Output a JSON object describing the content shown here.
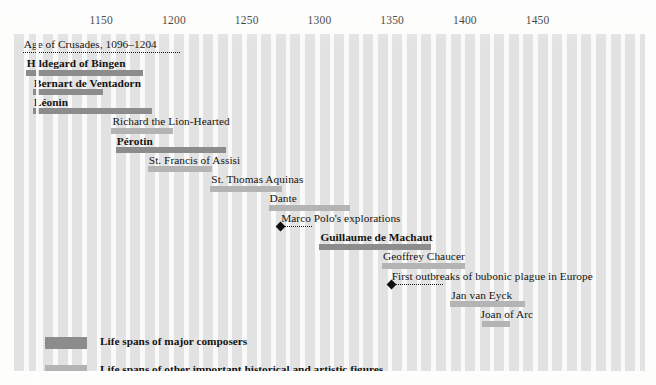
{
  "chart_data": {
    "type": "bar",
    "orientation": "horizontal",
    "title": "",
    "xlabel": "",
    "ylabel": "",
    "xlim": [
      1090,
      1470
    ],
    "grid": true,
    "grid_style": "vertical decade stripes",
    "legend_position": "bottom-left",
    "axis_ticks": [
      {
        "label": "1150",
        "value": 1150
      },
      {
        "label": "1200",
        "value": 1200
      },
      {
        "label": "1250",
        "value": 1250
      },
      {
        "label": "1300",
        "value": 1300
      },
      {
        "label": "1350",
        "value": 1350
      },
      {
        "label": "1400",
        "value": 1400
      },
      {
        "label": "1450",
        "value": 1450
      }
    ],
    "series": [
      {
        "name": "Life spans of major composers",
        "color": "#8c8c8c"
      },
      {
        "name": "Life spans of other important historical and artistic figures",
        "color": "#b4b4b4"
      },
      {
        "name": "Historical events",
        "color": "#111111"
      }
    ],
    "rows": [
      {
        "label": "Age of Crusades, 1096–1204",
        "kind": "event-span",
        "start": 1096,
        "end": 1204,
        "label_start": 1096
      },
      {
        "label": "Hildegard of Bingen",
        "kind": "composer",
        "start": 1098,
        "end": 1179,
        "label_start": 1098
      },
      {
        "label": "Bernart de Ventadorn",
        "kind": "composer",
        "start": 1103,
        "end": 1151,
        "label_start": 1103
      },
      {
        "label": "Léonin",
        "kind": "composer",
        "start": 1103,
        "end": 1185,
        "label_start": 1103
      },
      {
        "label": "Richard the Lion-Hearted",
        "kind": "figure",
        "start": 1157,
        "end": 1199,
        "label_start": 1157
      },
      {
        "label": "Pérotin",
        "kind": "composer",
        "start": 1160,
        "end": 1236,
        "label_start": 1160
      },
      {
        "label": "St. Francis of Assisi",
        "kind": "figure",
        "start": 1182,
        "end": 1226,
        "label_start": 1182
      },
      {
        "label": "St. Thomas Aquinas",
        "kind": "figure",
        "start": 1225,
        "end": 1274,
        "label_start": 1225
      },
      {
        "label": "Dante",
        "kind": "figure",
        "start": 1265,
        "end": 1321,
        "label_start": 1265
      },
      {
        "label": "Marco Polo's explorations",
        "kind": "event",
        "start": 1271,
        "end": 1295,
        "label_start": 1273
      },
      {
        "label": "Guillaume de Machaut",
        "kind": "composer",
        "start": 1300,
        "end": 1377,
        "label_start": 1300
      },
      {
        "label": "Geoffrey Chaucer",
        "kind": "figure",
        "start": 1343,
        "end": 1400,
        "label_start": 1343
      },
      {
        "label": "First outbreaks of bubonic plague in Europe",
        "kind": "event",
        "start": 1347,
        "end": 1385,
        "label_start": 1349
      },
      {
        "label": "Jan van Eyck",
        "kind": "figure",
        "start": 1390,
        "end": 1441,
        "label_start": 1390
      },
      {
        "label": "Joan of Arc",
        "kind": "figure",
        "start": 1412,
        "end": 1431,
        "label_start": 1410
      }
    ]
  },
  "legend": {
    "items": [
      {
        "label": "Life spans of major composers",
        "kind": "composer"
      },
      {
        "label": "Life spans of other important historical and artistic figures",
        "kind": "figure"
      },
      {
        "label": "Historical events",
        "kind": "event"
      }
    ]
  }
}
